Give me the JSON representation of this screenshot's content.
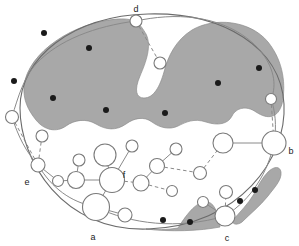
{
  "figure": {
    "title": "",
    "type": "schematic-map-diagram",
    "canvas": {
      "width": 299,
      "height": 246
    },
    "background_color": "#ffffff",
    "outline_color": "#6b6b6b",
    "shaded_region_color": "#a8a8a8",
    "shaded_region_edge_color": "#8d8d8d",
    "node_fill_color": "#ffffff",
    "node_stroke_color": "#7a7a7a",
    "point_color": "#1a1a1a",
    "edge_color": "#8a8a8a",
    "label_color": "#1a1a1a"
  },
  "labels": [
    {
      "id": "label-d",
      "text": "d",
      "x": 136,
      "y": 10
    },
    {
      "id": "label-b",
      "text": "b",
      "x": 291,
      "y": 152
    },
    {
      "id": "label-e",
      "text": "e",
      "x": 27,
      "y": 183
    },
    {
      "id": "label-f",
      "text": "f",
      "x": 124,
      "y": 176
    },
    {
      "id": "label-a",
      "text": "a",
      "x": 93,
      "y": 238
    },
    {
      "id": "label-c",
      "text": "c",
      "x": 227,
      "y": 239
    }
  ],
  "boundary": {
    "name": "region-outline-ellipse",
    "path": "M 20,108 C 20,58 72,16 148,14 C 224,12 281,48 284,104 C 287,158 240,226 148,229 C 62,232 20,160 20,108 Z"
  },
  "shaded_regions": [
    {
      "id": "shaded-region-upper",
      "name": "upper-shaded-habitat",
      "path": "M 24,86 C 28,52 74,22 118,19 C 136,18 140,24 146,34 C 152,46 146,62 140,76 C 134,90 136,98 144,98 C 154,98 160,86 164,72 C 168,56 176,40 192,30 C 214,17 250,20 268,42 C 284,62 286,86 282,104 C 278,118 268,120 256,112 C 246,105 236,108 232,116 C 228,124 218,126 206,122 C 194,118 186,122 178,126 C 170,130 160,128 152,122 C 144,116 134,118 126,124 C 116,131 106,130 96,124 C 86,118 74,120 66,126 C 56,133 44,130 36,120 C 28,110 23,100 24,86 Z"
    },
    {
      "id": "shaded-region-bottom-left",
      "name": "bottom-shaded-patch",
      "path": "M 146,229 C 156,230 166,230 178,228 C 188,212 198,200 208,202 C 216,204 218,216 220,227 C 200,231 170,232 146,229 Z"
    },
    {
      "id": "shaded-region-bottom-right",
      "name": "right-shaded-strip",
      "path": "M 232,221 C 240,212 248,204 254,194 C 258,186 262,178 268,172 C 274,166 280,166 281,172 C 282,180 274,188 268,196 C 260,206 250,214 242,222 C 238,225 233,225 232,221 Z"
    }
  ],
  "points": [
    {
      "id": "point-1",
      "x": 44,
      "y": 33,
      "r": 3.0
    },
    {
      "id": "point-2",
      "x": 89,
      "y": 48,
      "r": 3.0
    },
    {
      "id": "point-3",
      "x": 14,
      "y": 81,
      "r": 3.0
    },
    {
      "id": "point-4",
      "x": 53,
      "y": 98,
      "r": 3.0
    },
    {
      "id": "point-5",
      "x": 106,
      "y": 110,
      "r": 3.0
    },
    {
      "id": "point-6",
      "x": 165,
      "y": 113,
      "r": 3.0
    },
    {
      "id": "point-7",
      "x": 218,
      "y": 83,
      "r": 3.0
    },
    {
      "id": "point-8",
      "x": 259,
      "y": 68,
      "r": 3.0
    },
    {
      "id": "point-9",
      "x": 163,
      "y": 220,
      "r": 3.0
    },
    {
      "id": "point-10",
      "x": 190,
      "y": 222,
      "r": 3.0
    },
    {
      "id": "point-11",
      "x": 240,
      "y": 201,
      "r": 3.0
    },
    {
      "id": "point-12",
      "x": 255,
      "y": 190,
      "r": 3.0
    }
  ],
  "nodes": [
    {
      "id": "n-d",
      "label": "d",
      "x": 136,
      "y": 21,
      "r": 6.0
    },
    {
      "id": "n-d2",
      "label": "",
      "x": 160,
      "y": 63,
      "r": 6.0
    },
    {
      "id": "n-b",
      "label": "b",
      "x": 274,
      "y": 143,
      "r": 12.0
    },
    {
      "id": "n-b1",
      "label": "",
      "x": 271,
      "y": 99,
      "r": 5.5
    },
    {
      "id": "n-b2",
      "label": "",
      "x": 223,
      "y": 143,
      "r": 10.0
    },
    {
      "id": "n-b3",
      "label": "",
      "x": 200,
      "y": 173,
      "r": 6.5
    },
    {
      "id": "n-e",
      "label": "e",
      "x": 38,
      "y": 165,
      "r": 7.0
    },
    {
      "id": "n-e1",
      "label": "",
      "x": 12,
      "y": 117,
      "r": 6.5
    },
    {
      "id": "n-e2",
      "label": "",
      "x": 42,
      "y": 136,
      "r": 6.0
    },
    {
      "id": "n-e3",
      "label": "",
      "x": 58,
      "y": 181,
      "r": 5.5
    },
    {
      "id": "n-a",
      "label": "a",
      "x": 96,
      "y": 207,
      "r": 13.5
    },
    {
      "id": "n-a1",
      "label": "",
      "x": 125,
      "y": 215,
      "r": 7.0
    },
    {
      "id": "n-g",
      "label": "",
      "x": 76,
      "y": 180,
      "r": 8.5
    },
    {
      "id": "n-g1",
      "label": "",
      "x": 79,
      "y": 160,
      "r": 6.0
    },
    {
      "id": "n-f",
      "label": "f",
      "x": 112,
      "y": 180,
      "r": 12.5
    },
    {
      "id": "n-f1",
      "label": "",
      "x": 105,
      "y": 155,
      "r": 11.0
    },
    {
      "id": "n-f2",
      "label": "",
      "x": 132,
      "y": 146,
      "r": 6.0
    },
    {
      "id": "n-f3",
      "label": "",
      "x": 141,
      "y": 183,
      "r": 8.0
    },
    {
      "id": "n-f4",
      "label": "",
      "x": 172,
      "y": 191,
      "r": 5.5
    },
    {
      "id": "n-h",
      "label": "",
      "x": 157,
      "y": 166,
      "r": 7.5
    },
    {
      "id": "n-h1",
      "label": "",
      "x": 176,
      "y": 149,
      "r": 6.0
    },
    {
      "id": "n-c",
      "label": "c",
      "x": 225,
      "y": 216,
      "r": 10.0
    },
    {
      "id": "n-c1",
      "label": "",
      "x": 226,
      "y": 192,
      "r": 6.5
    },
    {
      "id": "n-c2",
      "label": "",
      "x": 203,
      "y": 202,
      "r": 5.5
    }
  ],
  "edges": [
    {
      "id": "edge-d-d2",
      "from": "n-d",
      "to": "n-d2",
      "style": "dashed"
    },
    {
      "id": "edge-b1-b",
      "from": "n-b1",
      "to": "n-b",
      "style": "dashed"
    },
    {
      "id": "edge-b2-b",
      "from": "n-b2",
      "to": "n-b",
      "style": "solid"
    },
    {
      "id": "edge-b3-b2",
      "from": "n-b3",
      "to": "n-b2",
      "style": "dashed"
    },
    {
      "id": "edge-h-b3",
      "from": "n-h",
      "to": "n-b3",
      "style": "dashed"
    },
    {
      "id": "edge-h-h1",
      "from": "n-h",
      "to": "n-h1",
      "style": "solid"
    },
    {
      "id": "edge-h-f3",
      "from": "n-h",
      "to": "n-f3",
      "style": "solid"
    },
    {
      "id": "edge-f3-f4",
      "from": "n-f3",
      "to": "n-f4",
      "style": "dashed"
    },
    {
      "id": "edge-f-f3",
      "from": "n-f",
      "to": "n-f3",
      "style": "dashed"
    },
    {
      "id": "edge-f-f2",
      "from": "n-f",
      "to": "n-f2",
      "style": "solid"
    },
    {
      "id": "edge-f-f1",
      "from": "n-f",
      "to": "n-f1",
      "style": "solid"
    },
    {
      "id": "edge-f-g",
      "from": "n-f",
      "to": "n-g",
      "style": "solid"
    },
    {
      "id": "edge-f-a",
      "from": "n-f",
      "to": "n-a",
      "style": "solid"
    },
    {
      "id": "edge-g-g1",
      "from": "n-g",
      "to": "n-g1",
      "style": "solid"
    },
    {
      "id": "edge-g-e3",
      "from": "n-g",
      "to": "n-e3",
      "style": "solid"
    },
    {
      "id": "edge-e-e3",
      "from": "n-e",
      "to": "n-e3",
      "style": "solid"
    },
    {
      "id": "edge-e-e2",
      "from": "n-e",
      "to": "n-e2",
      "style": "dashed"
    },
    {
      "id": "edge-e-e1",
      "from": "n-e",
      "to": "n-e1",
      "style": "dashed"
    },
    {
      "id": "edge-a-a1",
      "from": "n-a",
      "to": "n-a1",
      "style": "solid"
    },
    {
      "id": "edge-c-c1",
      "from": "n-c",
      "to": "n-c1",
      "style": "dashed"
    },
    {
      "id": "edge-c-c2",
      "from": "n-c",
      "to": "n-c2",
      "style": "solid"
    }
  ],
  "boundary_paths": [
    {
      "id": "bpath-e-a",
      "name": "boundary-arc-e-to-a",
      "path": "M 38,165 C 52,188 70,202 96,207",
      "style": "solid"
    },
    {
      "id": "bpath-a-c",
      "name": "boundary-arc-a-to-c",
      "path": "M 96,207 C 130,224 178,230 225,216",
      "style": "solid"
    },
    {
      "id": "bpath-c-b",
      "name": "boundary-arc-c-to-b",
      "path": "M 225,216 C 252,199 268,172 274,143",
      "style": "solid"
    },
    {
      "id": "bpath-b-b1",
      "name": "boundary-arc-b-to-b1",
      "path": "M 274,143 C 277,126 275,110 271,99",
      "style": "solid"
    },
    {
      "id": "bpath-b1-d",
      "name": "boundary-arc-b1-to-d",
      "path": "M 271,99 C 284,70 254,26 196,18 C 176,15 154,17 136,21",
      "style": "solid"
    },
    {
      "id": "bpath-d-e1",
      "name": "boundary-arc-d-to-e1",
      "path": "M 136,21 C 96,26 58,40 36,64 C 24,77 18,97 12,117",
      "style": "solid"
    },
    {
      "id": "bpath-e1-e",
      "name": "boundary-arc-e1-to-e",
      "path": "M 12,117 C 18,136 26,152 38,165",
      "style": "solid"
    }
  ]
}
